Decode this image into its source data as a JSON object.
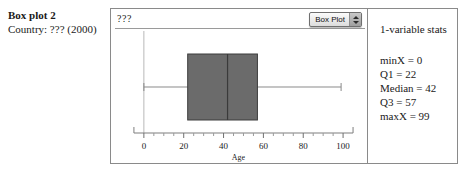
{
  "caption": {
    "title": "Box plot 2",
    "subtitle": "Country: ??? (2000)"
  },
  "plot": {
    "series_label": "???",
    "popup": {
      "selected": "Box Plot",
      "arrows_icon": "updown-chevron-icon"
    },
    "axis_label": "Age",
    "tick_labels": [
      "0",
      "20",
      "40",
      "60",
      "80",
      "100"
    ]
  },
  "stats": {
    "title": "1-variable stats",
    "rows": [
      "minX = 0",
      "Q1 = 22",
      "Median = 42",
      "Q3 = 57",
      "maxX = 99"
    ]
  },
  "chart_data": {
    "type": "box",
    "title": "",
    "xlabel": "Age",
    "ylabel": "",
    "series_name": "???",
    "xlim": [
      -5,
      105
    ],
    "xticks": [
      0,
      20,
      40,
      60,
      80,
      100
    ],
    "minor_tick_step": 5,
    "grid": false,
    "legend": "none",
    "boxes": [
      {
        "label": "???",
        "min": 0,
        "q1": 22,
        "median": 42,
        "q3": 57,
        "max": 99
      }
    ],
    "colors": {
      "box_fill": "#6b6b6b",
      "box_edge": "#3d3d3d",
      "median_line": "#3a3a3a",
      "whisker": "#8a8a8a",
      "axis": "#7d7d7d",
      "frame": "#8a8a8a"
    }
  }
}
